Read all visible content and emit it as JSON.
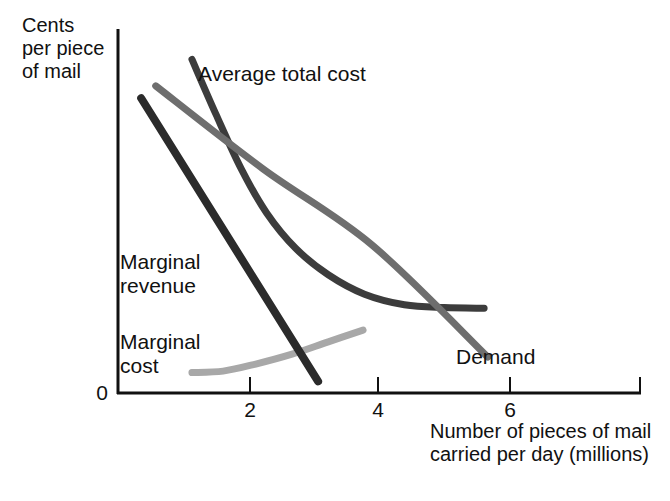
{
  "chart_data": {
    "type": "line",
    "title": "",
    "xlabel": "Number of pieces of mail carried per day (millions)",
    "ylabel": "Cents per piece of mail",
    "xlim": [
      0,
      7.2
    ],
    "ylim": [
      0,
      10
    ],
    "grid": false,
    "legend_position": "inline-labels",
    "x_ticks": [
      "2",
      "4",
      "6"
    ],
    "y_ticks": [
      "0"
    ],
    "series": [
      {
        "name": "Average total cost",
        "color": "#3c3c3c",
        "points": [
          [
            1.02,
            9.45
          ],
          [
            1.35,
            7.9
          ],
          [
            1.7,
            6.35
          ],
          [
            2.05,
            5.1
          ],
          [
            2.45,
            4.1
          ],
          [
            2.9,
            3.35
          ],
          [
            3.4,
            2.8
          ],
          [
            3.95,
            2.5
          ],
          [
            4.5,
            2.42
          ],
          [
            5.05,
            2.4
          ]
        ]
      },
      {
        "name": "Demand",
        "color": "#6e6e6e",
        "points": [
          [
            0.52,
            8.7
          ],
          [
            2.0,
            6.35
          ],
          [
            3.5,
            4.2
          ],
          [
            5.1,
            1.02
          ]
        ]
      },
      {
        "name": "Marginal revenue",
        "color": "#2b2b2b",
        "points": [
          [
            0.32,
            8.35
          ],
          [
            2.76,
            0.33
          ]
        ]
      },
      {
        "name": "Marginal cost",
        "color": "#a8a8a8",
        "points": [
          [
            1.02,
            0.58
          ],
          [
            1.45,
            0.62
          ],
          [
            1.9,
            0.82
          ],
          [
            2.4,
            1.1
          ],
          [
            2.9,
            1.45
          ],
          [
            3.38,
            1.78
          ]
        ]
      }
    ]
  },
  "axes": {
    "y_title": "Cents\nper piece\nof mail",
    "x_title": "Number of pieces of mail\ncarried per day (millions)",
    "origin_label": "0",
    "x_tick_labels": {
      "t2": "2",
      "t4": "4",
      "t6": "6"
    }
  },
  "curve_labels": {
    "average_total_cost": "Average total cost",
    "marginal_revenue": "Marginal\nrevenue",
    "marginal_cost": "Marginal\ncost",
    "demand": "Demand"
  },
  "colors": {
    "axis": "#111111",
    "average_total_cost": "#3c3c3c",
    "demand": "#6e6e6e",
    "marginal_revenue": "#2b2b2b",
    "marginal_cost": "#a8a8a8",
    "background": "#ffffff",
    "text": "#111111"
  }
}
